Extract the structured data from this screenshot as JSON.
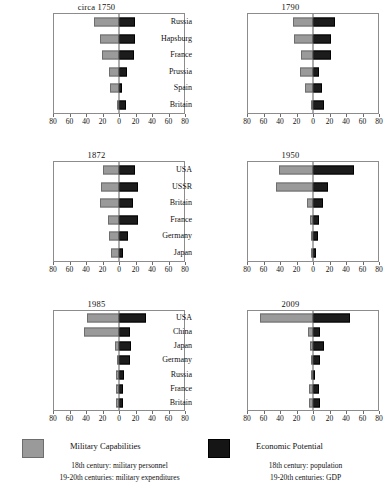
{
  "chart_data": {
    "type": "bar",
    "title": "",
    "subtitle": "",
    "layout": {
      "rows": 3,
      "cols": 2,
      "order": "row-major"
    },
    "xlabel": "",
    "ylabel": "",
    "xlim": [
      -80,
      80
    ],
    "grid": false,
    "axis_ticks": [
      {
        "value": -80,
        "label": "80"
      },
      {
        "value": -60,
        "label": "60"
      },
      {
        "value": -40,
        "label": "40"
      },
      {
        "value": -20,
        "label": "20"
      },
      {
        "value": 0,
        "label": "0"
      },
      {
        "value": 20,
        "label": "20"
      },
      {
        "value": 40,
        "label": "40"
      },
      {
        "value": 60,
        "label": "60"
      },
      {
        "value": 80,
        "label": "80"
      }
    ],
    "series": [
      {
        "name": "Military Capabilities",
        "color": "#9a9a9a",
        "direction": "left"
      },
      {
        "name": "Economic Potential",
        "color": "#1c1c1c",
        "direction": "right"
      }
    ],
    "legend": {
      "position": "bottom",
      "entries": [
        {
          "swatch": "military-capabilities-swatch",
          "color": "#9a9a9a",
          "title": "Military Capabilities",
          "notes": [
            "18th century: military personnel",
            "19-20th centuries: military expenditures"
          ]
        },
        {
          "swatch": "economic-potential-swatch",
          "color": "#1c1c1c",
          "title": "Economic Potential",
          "notes": [
            "18th century: population",
            "19-20th centuries: GDP"
          ]
        }
      ]
    },
    "panels": [
      {
        "title": "circa 1750",
        "categories": [
          "France",
          "Russia",
          "Hapsburg",
          "Britain",
          "Prussia",
          "Spain"
        ],
        "military": [
          31,
          23,
          21,
          12,
          11,
          2
        ],
        "economic": [
          20,
          20,
          18,
          10,
          4,
          8
        ]
      },
      {
        "title": "1790",
        "categories": [
          "Russia",
          "Hapsburg",
          "France",
          "Prussia",
          "Spain",
          "Britain"
        ],
        "military": [
          25,
          24,
          15,
          16,
          10,
          3
        ],
        "economic": [
          27,
          22,
          22,
          7,
          11,
          13
        ]
      },
      {
        "title": "1872",
        "categories": [
          "Russia",
          "Britain",
          "France",
          "USA",
          "Prussia",
          "Austria"
        ],
        "military": [
          20,
          22,
          23,
          13,
          12,
          10
        ],
        "economic": [
          20,
          23,
          17,
          23,
          11,
          5
        ]
      },
      {
        "title": "1950",
        "categories": [
          "USA",
          "USSR",
          "Britain",
          "France",
          "Germany",
          "Japan"
        ],
        "military": [
          42,
          45,
          8,
          4,
          1,
          1
        ],
        "economic": [
          50,
          19,
          12,
          7,
          6,
          4
        ]
      },
      {
        "title": "1985",
        "categories": [
          "USA",
          "USSR",
          "China",
          "Japan",
          "Germany",
          "Britain",
          "France"
        ],
        "military": [
          40,
          43,
          5,
          3,
          4,
          4,
          4
        ],
        "economic": [
          33,
          14,
          15,
          13,
          6,
          5,
          5
        ]
      },
      {
        "title": "2009",
        "categories": [
          "USA",
          "China",
          "Japan",
          "Germany",
          "Russia",
          "France",
          "Britain"
        ],
        "military": [
          65,
          6,
          4,
          3,
          3,
          5,
          5
        ],
        "economic": [
          46,
          9,
          14,
          9,
          3,
          7,
          8
        ]
      }
    ]
  }
}
